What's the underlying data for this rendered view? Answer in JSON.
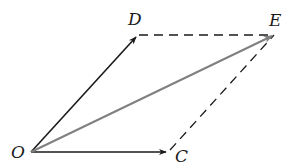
{
  "diagram": {
    "type": "vector-parallelogram",
    "points": {
      "O": {
        "label": "O",
        "x": 31,
        "y": 152
      },
      "D": {
        "label": "D",
        "x": 137,
        "y": 35
      },
      "E": {
        "label": "E",
        "x": 274,
        "y": 35
      },
      "C": {
        "label": "C",
        "x": 168,
        "y": 152
      }
    },
    "labels": {
      "O": "O",
      "D": "D",
      "E": "E",
      "C": "C"
    },
    "edges": [
      {
        "from": "O",
        "to": "D",
        "style": "solid-arrow",
        "color": "#1a1a1a"
      },
      {
        "from": "O",
        "to": "C",
        "style": "solid-arrow",
        "color": "#1a1a1a"
      },
      {
        "from": "O",
        "to": "E",
        "style": "solid-arrow",
        "color": "#808080"
      },
      {
        "from": "D",
        "to": "E",
        "style": "dashed",
        "color": "#1a1a1a"
      },
      {
        "from": "C",
        "to": "E",
        "style": "dashed",
        "color": "#1a1a1a"
      }
    ],
    "colors": {
      "ink": "#1a1a1a",
      "resultant": "#808080",
      "background": "#ffffff"
    }
  }
}
